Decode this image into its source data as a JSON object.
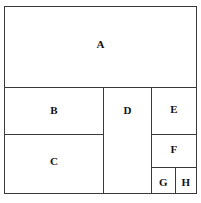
{
  "figure": {
    "type": "rectangle-partition-diagram",
    "canvas": {
      "width": 201,
      "height": 203
    },
    "background_color": "#ffffff",
    "line_color": "#3a3a3a",
    "label_color": "#101010",
    "outer_border": {
      "x": 4,
      "y": 6,
      "width": 193,
      "height": 188
    },
    "regions": [
      {
        "id": "A",
        "label": "A",
        "x": 4,
        "y": 6,
        "width": 193,
        "height": 82
      },
      {
        "id": "B",
        "label": "B",
        "x": 4,
        "y": 87,
        "width": 100,
        "height": 48
      },
      {
        "id": "C",
        "label": "C",
        "x": 4,
        "y": 134,
        "width": 100,
        "height": 60
      },
      {
        "id": "D",
        "label": "D",
        "x": 103,
        "y": 87,
        "width": 49,
        "height": 107
      },
      {
        "id": "E",
        "label": "E",
        "x": 151,
        "y": 87,
        "width": 46,
        "height": 48
      },
      {
        "id": "F",
        "label": "F",
        "x": 151,
        "y": 134,
        "width": 46,
        "height": 34
      },
      {
        "id": "G",
        "label": "G",
        "x": 151,
        "y": 167,
        "width": 25,
        "height": 27
      },
      {
        "id": "H",
        "label": "H",
        "x": 175,
        "y": 167,
        "width": 22,
        "height": 27
      }
    ]
  }
}
